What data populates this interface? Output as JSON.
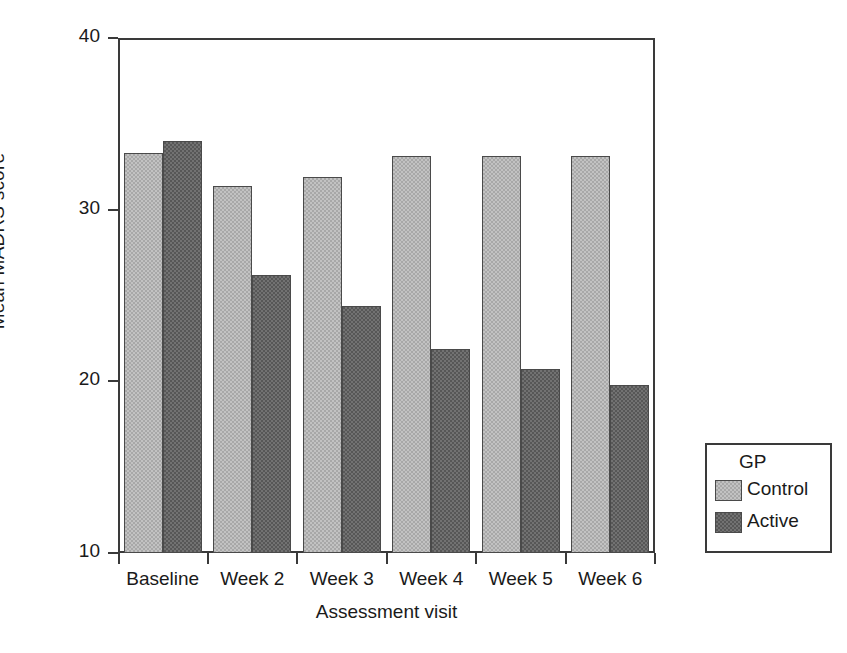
{
  "chart_data": {
    "type": "bar",
    "title": "",
    "xlabel": "Assessment visit",
    "ylabel": "Mean MADRS score",
    "categories": [
      "Baseline",
      "Week 2",
      "Week 3",
      "Week 4",
      "Week 5",
      "Week 6"
    ],
    "series": [
      {
        "name": "Control",
        "color": "#a8a8a8",
        "values": [
          33.3,
          31.4,
          31.9,
          33.1,
          33.1,
          33.1
        ]
      },
      {
        "name": "Active",
        "color": "#575757",
        "values": [
          34.0,
          26.2,
          24.4,
          21.9,
          20.7,
          19.8
        ]
      }
    ],
    "ylim": [
      10,
      40
    ],
    "yticks": [
      "10",
      "20",
      "30",
      "40"
    ],
    "ytick_values": [
      10,
      20,
      30,
      40
    ],
    "grid": false,
    "legend_position": "right-outside",
    "legend_title": "GP"
  },
  "legend": {
    "title": "GP",
    "entries": [
      {
        "label": "Control",
        "color": "#a8a8a8"
      },
      {
        "label": "Active",
        "color": "#575757"
      }
    ]
  },
  "axes": {
    "x_title": "Assessment visit",
    "y_title": "Mean MADRS score"
  },
  "colors": {
    "control": "#a8a8a8",
    "active": "#575757",
    "frame": "#3a3a3a",
    "background": "#ffffff"
  }
}
